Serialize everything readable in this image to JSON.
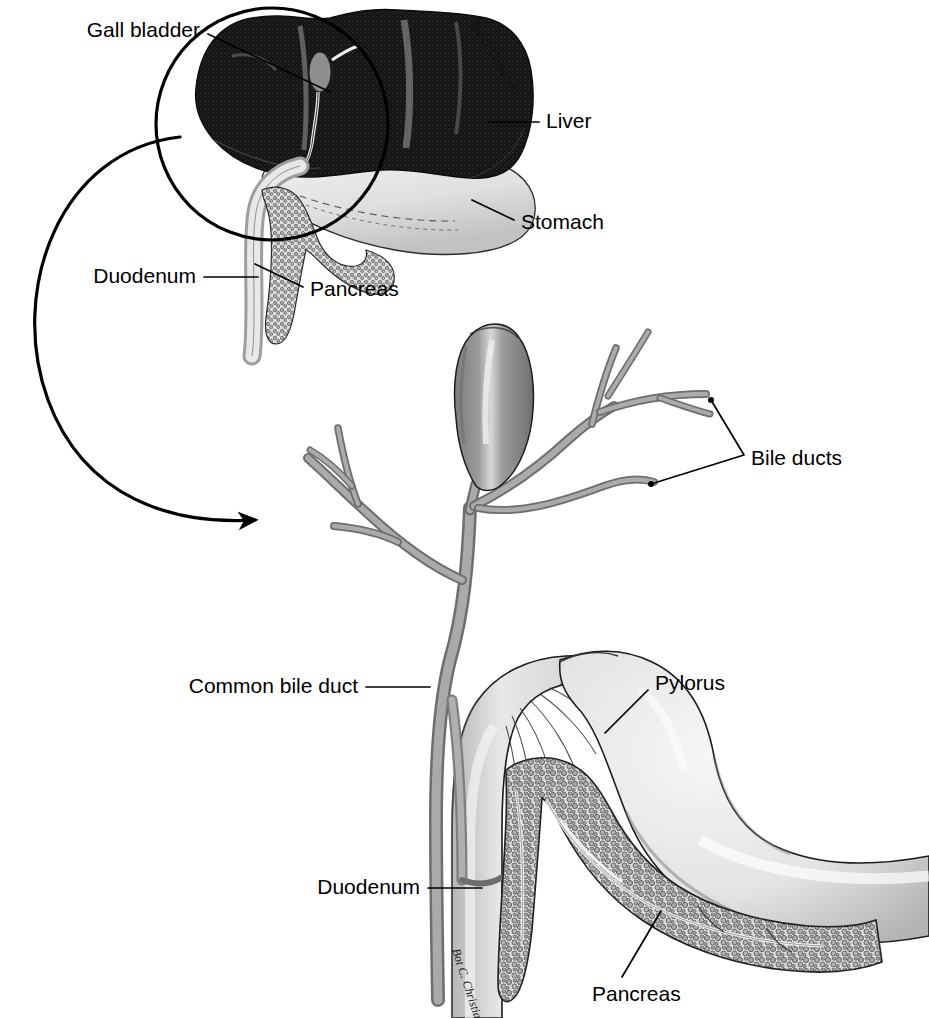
{
  "figure": {
    "background_color": "#ffffff",
    "width": 929,
    "height": 1018,
    "artist_signature": "Bot C. Christian"
  },
  "colors": {
    "ink": "#000000",
    "liver_dark": "#1b1b1b",
    "duct_gray": "#8f8f8f",
    "duct_gray_light": "#b9b9b9",
    "gallbladder_gray": "#8a8a8a",
    "gallbladder_highlight": "#d7d7d7",
    "organ_light": "#e2e2e2",
    "organ_mid": "#c9c9c9",
    "pancreas_gray": "#a8a8a8",
    "stomach_light": "#ededed"
  },
  "inset": {
    "name": "overview-inset",
    "description": "Upper overview of liver, stomach, gallbladder, pancreas and duodenum with magnification circle",
    "magnifier": {
      "cx": 272,
      "cy": 124,
      "r": 116
    },
    "labels": [
      {
        "id": "gall-bladder",
        "text": "Gall bladder",
        "x": 200,
        "y": 31,
        "anchor": "end",
        "leader": "M 208,34 L 330,92"
      },
      {
        "id": "liver",
        "text": "Liver",
        "x": 546,
        "y": 122,
        "anchor": "start",
        "leader": "M 539,122 L 489,122"
      },
      {
        "id": "stomach",
        "text": "Stomach",
        "x": 521,
        "y": 223,
        "anchor": "start",
        "leader": "M 514,220 L 472,200"
      },
      {
        "id": "duodenum",
        "text": "Duodenum",
        "x": 196,
        "y": 277,
        "anchor": "end",
        "leader": "M 204,277 L 258,277"
      },
      {
        "id": "pancreas",
        "text": "Pancreas",
        "x": 310,
        "y": 290,
        "anchor": "start",
        "leader": "M 303,287 L 255,264"
      }
    ]
  },
  "magnification_arrow": {
    "name": "magnification-arrow",
    "description": "Curved arrow linking the inset magnifier circle to the enlarged lower view",
    "path": "M 180,137 C 60,150 8,290 48,400 C 85,500 175,525 255,520",
    "arrow_tip": {
      "x": 275,
      "y": 521
    }
  },
  "detail": {
    "name": "detail-view",
    "description": "Enlarged view of gallbladder, bile ducts, common bile duct, pylorus, duodenum and pancreas",
    "labels": [
      {
        "id": "bile-ducts",
        "text": "Bile ducts",
        "x": 751,
        "y": 459,
        "anchor": "start",
        "leader": "M 711,407 L 744,455 M 744,455 L 651,484"
      },
      {
        "id": "common-bile-duct",
        "text": "Common bile duct",
        "x": 358,
        "y": 687,
        "anchor": "end",
        "leader": "M 366,687 L 424,687"
      },
      {
        "id": "pylorus",
        "text": "Pylorus",
        "x": 655,
        "y": 684,
        "anchor": "start",
        "leader": "M 648,690 L 605,733"
      },
      {
        "id": "duodenum",
        "text": "Duodenum",
        "x": 420,
        "y": 888,
        "anchor": "end",
        "leader": "M 428,888 L 478,888"
      },
      {
        "id": "pancreas",
        "text": "Pancreas",
        "x": 592,
        "y": 995,
        "anchor": "start",
        "leader": "M 622,977 L 661,911"
      }
    ]
  },
  "anatomy_parts": [
    {
      "id": "liver",
      "label": "Liver",
      "view": "inset"
    },
    {
      "id": "gall-bladder",
      "label": "Gall bladder",
      "view": "inset"
    },
    {
      "id": "stomach",
      "label": "Stomach",
      "view": "inset"
    },
    {
      "id": "pancreas",
      "label": "Pancreas",
      "view": "both"
    },
    {
      "id": "duodenum",
      "label": "Duodenum",
      "view": "both"
    },
    {
      "id": "bile-ducts",
      "label": "Bile ducts",
      "view": "detail"
    },
    {
      "id": "common-bile-duct",
      "label": "Common bile duct",
      "view": "detail"
    },
    {
      "id": "pylorus",
      "label": "Pylorus",
      "view": "detail"
    }
  ]
}
